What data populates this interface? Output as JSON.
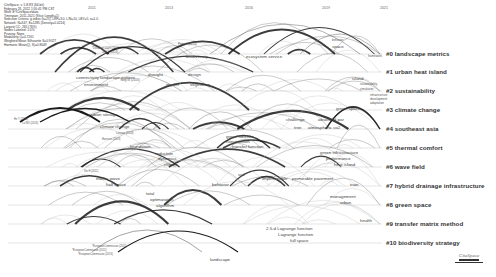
{
  "meta": {
    "lines": [
      "CiteSpace, v. 5.8.R3 (64-bit)",
      "February 26, 2022 1:50:41 PM CST",
      "WoS: E:\\CiteSpace\\data",
      "Timespan: 2011-2021 (Slice Length=1)",
      "Selection Criteria: g-index (k=25), LRF=3.0, L/N=10, LBY=5, e=1.0",
      "Network: N=347, E=1285 (Density=0.0214)",
      "Largest CC: 265 (76%)",
      "Nodes Labeled: 1.0%",
      "Pruning: None",
      "Modularity Q=0.7261",
      "Weighted Mean Silhouette S=0.9027",
      "Harmonic Mean(Q, S)=0.8049"
    ]
  },
  "timeline": {
    "years": [
      {
        "label": "2011",
        "x": 88
      },
      {
        "label": "2013",
        "x": 165
      },
      {
        "label": "2016",
        "x": 245
      },
      {
        "label": "2019",
        "x": 322
      },
      {
        "label": "2021",
        "x": 380
      }
    ]
  },
  "clusters": [
    {
      "id": "#0",
      "label": "#0 landscape metrics",
      "y": 54
    },
    {
      "id": "#1",
      "label": "#1 urban heat island",
      "y": 72
    },
    {
      "id": "#2",
      "label": "#2 sustainability",
      "y": 91
    },
    {
      "id": "#3",
      "label": "#3 climate change",
      "y": 110
    },
    {
      "id": "#4",
      "label": "#4 southeast asia",
      "y": 129
    },
    {
      "id": "#5",
      "label": "#5 thermal comfort",
      "y": 148
    },
    {
      "id": "#6",
      "label": "#6 wave field",
      "y": 167
    },
    {
      "id": "#7",
      "label": "#7 hybrid drainage infrastructure",
      "y": 186
    },
    {
      "id": "#8",
      "label": "#8 green space",
      "y": 205
    },
    {
      "id": "#9",
      "label": "#9 transfer matrix method",
      "y": 224
    },
    {
      "id": "#10",
      "label": "#10 biodiversity strategy",
      "y": 243
    }
  ],
  "node_labels": [
    {
      "text": "biodiversity",
      "x": 186,
      "y": 58,
      "cls": ""
    },
    {
      "text": "Peng J (2016)",
      "x": 178,
      "y": 46,
      "cls": "small"
    },
    {
      "text": "ecosystem service",
      "x": 246,
      "y": 58,
      "cls": ""
    },
    {
      "text": "behavior",
      "x": 332,
      "y": 42,
      "cls": "small"
    },
    {
      "text": "space",
      "x": 332,
      "y": 48,
      "cls": ""
    },
    {
      "text": "framework",
      "x": 368,
      "y": 58,
      "cls": "small"
    },
    {
      "text": "*Del Angel 2009 (2016)",
      "x": 92,
      "y": 51,
      "cls": "tiny"
    },
    {
      "text": "Jin CY (2016)",
      "x": 102,
      "y": 55,
      "cls": "tiny"
    },
    {
      "text": "connectivity",
      "x": 76,
      "y": 79,
      "cls": ""
    },
    {
      "text": "landscape pattern",
      "x": 100,
      "y": 79,
      "cls": ""
    },
    {
      "text": "drought",
      "x": 148,
      "y": 76,
      "cls": ""
    },
    {
      "text": "design",
      "x": 188,
      "y": 76,
      "cls": ""
    },
    {
      "text": "environment",
      "x": 84,
      "y": 86,
      "cls": ""
    },
    {
      "text": "Tang W (2016)",
      "x": 120,
      "y": 82,
      "cls": "small"
    },
    {
      "text": "impact",
      "x": 166,
      "y": 86,
      "cls": ""
    },
    {
      "text": "vegetation",
      "x": 190,
      "y": 86,
      "cls": ""
    },
    {
      "text": "island",
      "x": 352,
      "y": 80,
      "cls": ""
    },
    {
      "text": "sustainability",
      "x": 360,
      "y": 86,
      "cls": "small"
    },
    {
      "text": "simulation",
      "x": 360,
      "y": 91,
      "cls": "small"
    },
    {
      "text": "infrastructure",
      "x": 370,
      "y": 97,
      "cls": "small"
    },
    {
      "text": "development",
      "x": 370,
      "y": 101,
      "cls": "small"
    },
    {
      "text": "adaptation",
      "x": 370,
      "y": 105,
      "cls": "small"
    },
    {
      "text": "green space",
      "x": 336,
      "y": 110,
      "cls": ""
    },
    {
      "text": "He Y (2016)",
      "x": 14,
      "y": 122,
      "cls": "tiny"
    },
    {
      "text": "Lu WX (2016)",
      "x": 22,
      "y": 126,
      "cls": "tiny"
    },
    {
      "text": "carbon storage",
      "x": 88,
      "y": 116,
      "cls": ""
    },
    {
      "text": "climate change",
      "x": 100,
      "y": 128,
      "cls": ""
    },
    {
      "text": "challenge",
      "x": 286,
      "y": 121,
      "cls": ""
    },
    {
      "text": "absorbed par",
      "x": 318,
      "y": 121,
      "cls": ""
    },
    {
      "text": "tree",
      "x": 294,
      "y": 129,
      "cls": ""
    },
    {
      "text": "atmospheric co2",
      "x": 308,
      "y": 129,
      "cls": ""
    },
    {
      "text": "Larsson (2018)",
      "x": 116,
      "y": 136,
      "cls": "tiny"
    },
    {
      "text": "Hanssen (2019)",
      "x": 102,
      "y": 142,
      "cls": "tiny"
    },
    {
      "text": "foundation",
      "x": 130,
      "y": 148,
      "cls": ""
    },
    {
      "text": "green function",
      "x": 226,
      "y": 138,
      "cls": ""
    },
    {
      "text": "construction",
      "x": 226,
      "y": 143,
      "cls": ""
    },
    {
      "text": "transfer function",
      "x": 232,
      "y": 148,
      "cls": ""
    },
    {
      "text": "reduction",
      "x": 155,
      "y": 155,
      "cls": ""
    },
    {
      "text": "dynamics",
      "x": 158,
      "y": 160,
      "cls": ""
    },
    {
      "text": "climate",
      "x": 164,
      "y": 166,
      "cls": ""
    },
    {
      "text": "green infrastructure",
      "x": 320,
      "y": 154,
      "cls": ""
    },
    {
      "text": "performance",
      "x": 326,
      "y": 160,
      "cls": ""
    },
    {
      "text": "heat island",
      "x": 334,
      "y": 166,
      "cls": ""
    },
    {
      "text": "Xie H (2011)",
      "x": 84,
      "y": 174,
      "cls": "tiny"
    },
    {
      "text": "elastic wave",
      "x": 96,
      "y": 180,
      "cls": ""
    },
    {
      "text": "half space",
      "x": 106,
      "y": 186,
      "cls": ""
    },
    {
      "text": "behavior",
      "x": 212,
      "y": 186,
      "cls": ""
    },
    {
      "text": "soil",
      "x": 238,
      "y": 176,
      "cls": ""
    },
    {
      "text": "impermeable",
      "x": 262,
      "y": 180,
      "cls": ""
    },
    {
      "text": "permeable pavement",
      "x": 292,
      "y": 180,
      "cls": ""
    },
    {
      "text": "train",
      "x": 350,
      "y": 186,
      "cls": ""
    },
    {
      "text": "total",
      "x": 146,
      "y": 195,
      "cls": ""
    },
    {
      "text": "optimization",
      "x": 150,
      "y": 201,
      "cls": ""
    },
    {
      "text": "algorithm",
      "x": 156,
      "y": 207,
      "cls": ""
    },
    {
      "text": "management",
      "x": 330,
      "y": 198,
      "cls": ""
    },
    {
      "text": "urban",
      "x": 340,
      "y": 204,
      "cls": ""
    },
    {
      "text": "health",
      "x": 360,
      "y": 222,
      "cls": ""
    },
    {
      "text": "2.5-d Lagrange function",
      "x": 266,
      "y": 230,
      "cls": ""
    },
    {
      "text": "Lagrange function",
      "x": 278,
      "y": 236,
      "cls": ""
    },
    {
      "text": "full space",
      "x": 290,
      "y": 242,
      "cls": ""
    },
    {
      "text": "*EuropeanCommission (2011)",
      "x": 92,
      "y": 249,
      "cls": "tiny"
    },
    {
      "text": "*EuropeanCommission (2011)",
      "x": 72,
      "y": 253,
      "cls": "tiny"
    },
    {
      "text": "*EuropeanCommission (2013)",
      "x": 78,
      "y": 257,
      "cls": "tiny"
    },
    {
      "text": "landscape",
      "x": 210,
      "y": 261,
      "cls": ""
    }
  ],
  "logo": {
    "text": "CiteSpace"
  },
  "colors": {
    "background": "#ffffff",
    "arc_dark": "#1a1a1a",
    "arc_mid": "#666666",
    "arc_light": "#bbbbbb",
    "timeline": "#c8c8c8",
    "cluster_label": "#333333"
  }
}
